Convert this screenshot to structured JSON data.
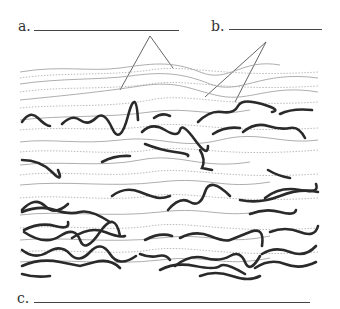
{
  "labels": {
    "a": "a.",
    "b": "b.",
    "c": "c."
  },
  "answers": {
    "a": "",
    "b": "",
    "c": ""
  },
  "colors": {
    "thin": "#888888",
    "dotted": "#aaaaaa",
    "thick": "#2a2a2a",
    "leader": "#555555"
  }
}
